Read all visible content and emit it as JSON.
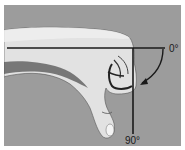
{
  "diagram": {
    "labels": {
      "start_angle": "0°",
      "end_angle": "90°"
    },
    "reference_lines": [
      {
        "name": "horizontal-baseline",
        "angle": "0°"
      },
      {
        "name": "vertical-line",
        "angle": "90°"
      }
    ],
    "arrow": {
      "direction": "clockwise",
      "from": "0°",
      "to": "90°"
    },
    "colors": {
      "background": "#9c9c9c",
      "border": "#ffffff",
      "lines": "#1a1a1a",
      "skin_light": "#e6e6e6",
      "skin_shadow": "#6e6e6e"
    }
  }
}
